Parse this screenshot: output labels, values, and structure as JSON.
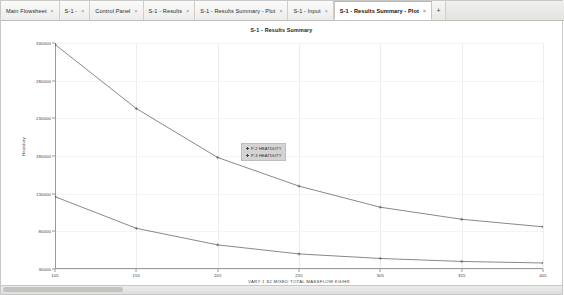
{
  "window": {
    "tabs": [
      {
        "label": "Main Flowsheet",
        "active": false
      },
      {
        "label": "S-1 -",
        "active": false
      },
      {
        "label": "Control Panel",
        "active": false
      },
      {
        "label": "S-1 - Results",
        "active": false
      },
      {
        "label": "S-1 - Results Summary - Plot",
        "active": false
      },
      {
        "label": "S-1 - Input",
        "active": false
      },
      {
        "label": "S-1 - Results Summary - Plot",
        "active": true
      }
    ],
    "new_tab_label": "+",
    "close_glyph": "×"
  },
  "chart_data": {
    "type": "line",
    "title": "S-1 - Results Summary",
    "xlabel": "VARY 1 S2 MIXED TOTAL MASSFLOW KG/HR",
    "ylabel": "Heatduty",
    "xlim": [
      105,
      405
    ],
    "ylim": [
      30000,
      330000
    ],
    "xticks": [
      105,
      155,
      205,
      255,
      305,
      355,
      405
    ],
    "yticks": [
      330000,
      280000,
      230000,
      180000,
      130000,
      80000,
      30000
    ],
    "grid": true,
    "legend_position": "center",
    "series": [
      {
        "name": "P-2 HEATDUTY",
        "color": "#555555",
        "x": [
          105,
          155,
          205,
          255,
          305,
          355,
          405
        ],
        "y": [
          328000,
          243000,
          178000,
          140000,
          112000,
          96000,
          86000
        ]
      },
      {
        "name": "P-3 HEATDUTY",
        "color": "#555555",
        "x": [
          105,
          155,
          205,
          255,
          305,
          355,
          405
        ],
        "y": [
          126000,
          84000,
          62000,
          50000,
          44000,
          40000,
          38000
        ]
      }
    ]
  }
}
